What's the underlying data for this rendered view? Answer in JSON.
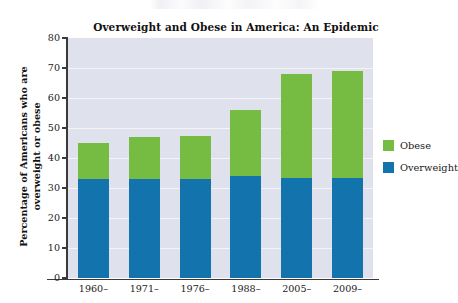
{
  "chart_data": {
    "type": "bar",
    "stacked": true,
    "title": "Overweight and Obese in America: An Epidemic",
    "xlabel": "",
    "ylabel": "Percentage of Americans who are\noverweight or obese",
    "categories": [
      "1960–",
      "1971–",
      "1976–",
      "1988–",
      "2005–",
      "2009–"
    ],
    "series": [
      {
        "name": "Overweight",
        "color": "#1273ad",
        "values": [
          33,
          33,
          33,
          34,
          33.5,
          33.5
        ]
      },
      {
        "name": "Obese",
        "color": "#76bc43",
        "values": [
          12,
          14,
          14.5,
          22,
          34.5,
          35.5
        ]
      }
    ],
    "totals": [
      45,
      47,
      47.5,
      56,
      68,
      69
    ],
    "ylim": [
      0,
      80
    ],
    "yticks": [
      0,
      10,
      20,
      30,
      40,
      50,
      60,
      70,
      80
    ],
    "ytick_labels": [
      "0",
      "10",
      "20",
      "30",
      "40",
      "50",
      "60",
      "70",
      "80"
    ],
    "grid": true,
    "legend_position": "right",
    "legend_entries": [
      {
        "label": "Obese",
        "color": "#76bc43"
      },
      {
        "label": "Overweight",
        "color": "#1273ad"
      }
    ],
    "plot_background": "#dfe2ec",
    "gridline_color": "#f2f4f8",
    "axis_color": "#3a3a3a"
  }
}
